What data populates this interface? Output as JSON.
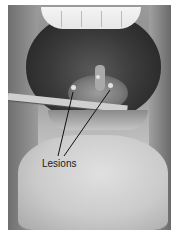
{
  "figure": {
    "annotation": {
      "label": "Lesions",
      "arrow_count": 2
    }
  }
}
